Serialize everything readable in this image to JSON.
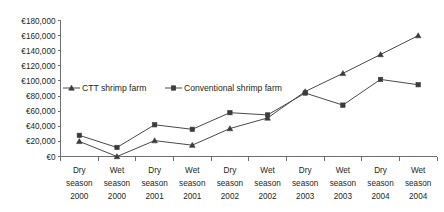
{
  "chart_data": {
    "type": "line",
    "title": "",
    "xlabel": "",
    "ylabel": "",
    "ylim": [
      0,
      180000
    ],
    "ytick_step": 20000,
    "grid": false,
    "legend_position": "inside-upper-left",
    "currency_symbol": "€",
    "categories": [
      "Dry season 2000",
      "Wet season 2000",
      "Dry season 2001",
      "Wet season 2001",
      "Dry season 2002",
      "Wet season 2002",
      "Dry season 2003",
      "Wet season 2003",
      "Dry season 2004",
      "Wet season 2004"
    ],
    "category_lines": [
      [
        "Dry",
        "season",
        "2000"
      ],
      [
        "Wet",
        "season",
        "2000"
      ],
      [
        "Dry",
        "season",
        "2001"
      ],
      [
        "Wet",
        "season",
        "2001"
      ],
      [
        "Dry",
        "season",
        "2002"
      ],
      [
        "Wet",
        "season",
        "2002"
      ],
      [
        "Dry",
        "season",
        "2003"
      ],
      [
        "Wet",
        "season",
        "2003"
      ],
      [
        "Dry",
        "season",
        "2004"
      ],
      [
        "Wet",
        "season",
        "2004"
      ]
    ],
    "ytick_labels": [
      "€180,000",
      "€160,000",
      "€140,000",
      "€120,000",
      "€100,000",
      "€80,000",
      "€60,000",
      "€40,000",
      "€20,000",
      "€0"
    ],
    "ytick_values": [
      180000,
      160000,
      140000,
      120000,
      100000,
      80000,
      60000,
      40000,
      20000,
      0
    ],
    "series": [
      {
        "name": "CTT shrimp farm",
        "marker": "triangle",
        "color": "#3b3b3d",
        "values": [
          20000,
          0,
          21000,
          15000,
          37000,
          51000,
          86000,
          110000,
          135000,
          160000
        ]
      },
      {
        "name": "Conventional shrimp farm",
        "marker": "square",
        "color": "#3b3b3d",
        "values": [
          28000,
          12000,
          42000,
          36000,
          58000,
          55000,
          84000,
          68000,
          102000,
          95000
        ]
      }
    ]
  },
  "legend": {
    "items": [
      {
        "label": "CTT shrimp farm",
        "marker": "triangle"
      },
      {
        "label": "Conventional shrimp farm",
        "marker": "square"
      }
    ]
  }
}
